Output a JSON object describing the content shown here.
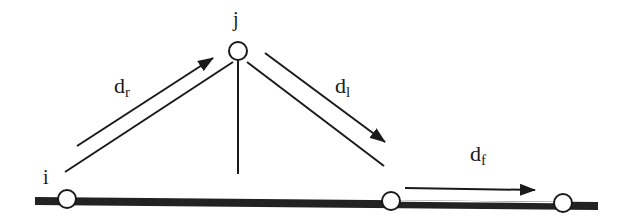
{
  "diagram": {
    "nodes": {
      "i": {
        "label": "i"
      },
      "j": {
        "label": "j"
      }
    },
    "arrows": {
      "rise": {
        "main": "d",
        "sub": "r"
      },
      "descend": {
        "main": "d",
        "sub": "l"
      },
      "forward": {
        "main": "d",
        "sub": "f"
      }
    },
    "colors": {
      "stroke": "#1a1a1a",
      "baseline": "#222222",
      "node_fill": "#ffffff",
      "background": "#ffffff"
    }
  }
}
